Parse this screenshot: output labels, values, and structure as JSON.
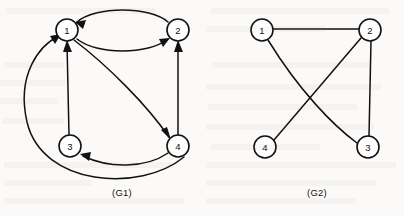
{
  "figure": {
    "background_color": "#fbfaf8",
    "ink_color": "#111111",
    "width": 404,
    "height": 216
  },
  "graphs": [
    {
      "id": "G1",
      "caption": "(G1)",
      "caption_x": 122,
      "caption_y": 192,
      "type": "directed",
      "node_radius": 11,
      "nodes": [
        {
          "label": "1",
          "x": 67,
          "y": 30
        },
        {
          "label": "2",
          "x": 178,
          "y": 30
        },
        {
          "label": "3",
          "x": 70,
          "y": 146
        },
        {
          "label": "4",
          "x": 178,
          "y": 146
        }
      ],
      "edges": [
        {
          "from": "2",
          "to": "1",
          "style": "arc-top",
          "path": "M 168 22 C 150 6, 95 6, 77 22",
          "arrow_x": 78,
          "arrow_y": 23,
          "arrow_angle": 140
        },
        {
          "from": "1",
          "to": "2",
          "style": "arc-bottom",
          "path": "M 77 39 C 97 55, 148 55, 168 39",
          "arrow_x": 167,
          "arrow_y": 40,
          "arrow_angle": -38
        },
        {
          "from": "3",
          "to": "1",
          "style": "straight",
          "path": "M 69 135 L 67 42",
          "arrow_x": 67,
          "arrow_y": 42,
          "arrow_angle": -88
        },
        {
          "from": "1",
          "to": "4",
          "style": "diagonal-arc",
          "path": "M 74 40 C 108 66, 146 104, 169 137",
          "arrow_x": 169,
          "arrow_y": 137,
          "arrow_angle": 55
        },
        {
          "from": "4",
          "to": "2",
          "style": "straight",
          "path": "M 178 135 L 178 42",
          "arrow_x": 178,
          "arrow_y": 42,
          "arrow_angle": -90
        },
        {
          "from": "4",
          "to": "3",
          "style": "arc-bottom",
          "path": "M 168 152 C 145 168, 105 168, 82 155",
          "arrow_x": 83,
          "arrow_y": 155,
          "arrow_angle": 160
        },
        {
          "from": "4",
          "to": "1",
          "style": "big-left-arc",
          "path": "M 184 156 C 140 192, 40 184, 27 120 C 16 72, 38 44, 58 35",
          "arrow_x": 58,
          "arrow_y": 35,
          "arrow_angle": -155
        }
      ]
    },
    {
      "id": "G2",
      "caption": "(G2)",
      "caption_x": 317,
      "caption_y": 192,
      "type": "undirected",
      "node_radius": 11,
      "nodes": [
        {
          "label": "1",
          "x": 262,
          "y": 30
        },
        {
          "label": "2",
          "x": 370,
          "y": 30
        },
        {
          "label": "4",
          "x": 265,
          "y": 147
        },
        {
          "label": "3",
          "x": 368,
          "y": 147
        }
      ],
      "edges": [
        {
          "from": "1",
          "to": "2",
          "style": "straight",
          "path": "M 273 29 L 359 29"
        },
        {
          "from": "2",
          "to": "3",
          "style": "straight",
          "path": "M 371 41 L 369 136"
        },
        {
          "from": "2",
          "to": "4",
          "style": "straight",
          "path": "M 361 38 L 274 140"
        },
        {
          "from": "1",
          "to": "3",
          "style": "slight-arc",
          "path": "M 268 40 C 300 92, 334 126, 357 143"
        }
      ]
    }
  ]
}
